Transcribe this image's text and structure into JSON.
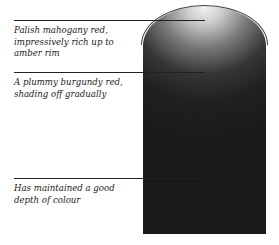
{
  "glass": {
    "label": "wine-glass-colour-diagram",
    "colors": {
      "rim": "#f0f0f0",
      "core": "#1c1c1c"
    }
  },
  "annotations": [
    {
      "text": "Palish mahogany red, impressively rich up to amber rim"
    },
    {
      "text": "A plummy burgundy red, shading off gradually"
    },
    {
      "text": "Has maintained a good depth of colour"
    }
  ]
}
